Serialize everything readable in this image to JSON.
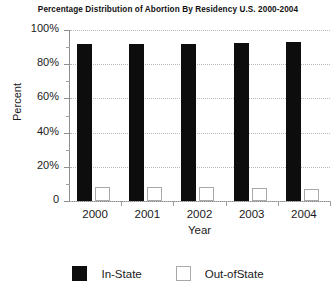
{
  "chart_data": {
    "type": "bar",
    "title": "Percentage Distribution of Abortion By Residency U.S. 2000-2004",
    "xlabel": "Year",
    "ylabel": "Percent",
    "categories": [
      "2000",
      "2001",
      "2002",
      "2003",
      "2004"
    ],
    "series": [
      {
        "name": "In-State",
        "color": "#0d0d0d",
        "values": [
          92,
          92,
          92,
          92.5,
          93
        ]
      },
      {
        "name": "Out-ofState",
        "color": "#ffffff",
        "values": [
          8,
          8,
          8,
          7.5,
          7
        ]
      }
    ],
    "ylim": [
      0,
      100
    ],
    "ytick_labels": [
      "0",
      "20%",
      "40%",
      "60%",
      "80%",
      "100%"
    ],
    "ytick_values": [
      0,
      20,
      40,
      60,
      80,
      100
    ],
    "yminor_values": [
      10,
      30,
      50,
      70,
      90
    ],
    "grid": true,
    "legend_position": "bottom"
  },
  "legend": {
    "items": [
      {
        "label": "In-State",
        "style": "filled"
      },
      {
        "label": "Out-ofState",
        "style": "hollow"
      }
    ]
  }
}
